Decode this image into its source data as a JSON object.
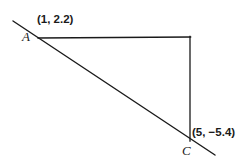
{
  "figure": {
    "background_color": "#ffffff",
    "stroke_color": "#1a1a1a",
    "vertices": [
      {
        "name": "A",
        "label": "A",
        "coord_label": "(1, 2.2)",
        "x": 1,
        "y": 2.2,
        "px": 38,
        "py": 38
      },
      {
        "name": "C",
        "label": "C",
        "coord_label": "(5, −5.4)",
        "x": 5,
        "y": -5.4,
        "px": 190,
        "py": 140
      }
    ],
    "segments": [
      {
        "name": "diagonal-line-through-a-and-c",
        "from_px": [
          13,
          21
        ],
        "to_px": [
          215,
          155
        ]
      },
      {
        "name": "horizontal-segment-a-to-corner",
        "from_px": [
          38,
          38
        ],
        "to_px": [
          190,
          37
        ]
      },
      {
        "name": "vertical-segment-corner-to-c",
        "from_px": [
          190,
          37
        ],
        "to_px": [
          190,
          140
        ]
      }
    ]
  },
  "labels": {
    "a_coord": "(1, 2.2)",
    "c_coord": "(5, −5.4)",
    "a_vertex": "A",
    "c_vertex": "C"
  }
}
